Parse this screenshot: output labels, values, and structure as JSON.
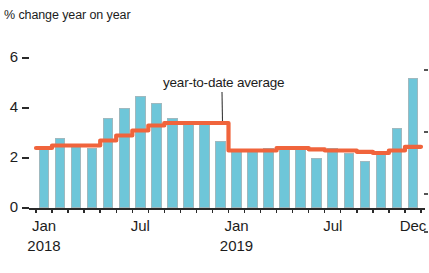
{
  "chart_data": {
    "type": "bar",
    "title": "% change year on year",
    "xlabel": "",
    "ylabel": "% change year on year",
    "ylim": [
      0,
      6
    ],
    "yticks": [
      0,
      2,
      4,
      6
    ],
    "ytick_labels": [
      "0",
      "2",
      "4",
      "6"
    ],
    "grid": false,
    "legend": "none",
    "categories": [
      "Jan 2018",
      "Feb 2018",
      "Mar 2018",
      "Apr 2018",
      "May 2018",
      "Jun 2018",
      "Jul 2018",
      "Aug 2018",
      "Sep 2018",
      "Oct 2018",
      "Nov 2018",
      "Dec 2018",
      "Jan 2019",
      "Feb 2019",
      "Mar 2019",
      "Apr 2019",
      "May 2019",
      "Jun 2019",
      "Jul 2019",
      "Aug 2019",
      "Sep 2019",
      "Oct 2019",
      "Nov 2019",
      "Dec 2019"
    ],
    "series": [
      {
        "name": "monthly % change year on year",
        "type": "bar",
        "values": [
          2.4,
          2.8,
          2.5,
          2.4,
          3.6,
          4.0,
          4.5,
          4.2,
          3.6,
          3.5,
          3.4,
          2.7,
          2.3,
          2.3,
          2.4,
          2.5,
          2.4,
          2.0,
          2.4,
          2.2,
          1.9,
          2.2,
          3.2,
          5.2
        ]
      },
      {
        "name": "year-to-date average",
        "type": "line",
        "color": "#f0643c",
        "values": [
          2.4,
          2.5,
          2.5,
          2.5,
          2.7,
          2.9,
          3.1,
          3.3,
          3.4,
          3.4,
          3.4,
          3.4,
          2.3,
          2.3,
          2.3,
          2.4,
          2.4,
          2.35,
          2.3,
          2.3,
          2.25,
          2.2,
          2.3,
          2.45
        ]
      }
    ],
    "annotations": [
      {
        "text": "year-to-date average",
        "target_category": "Dec 2018"
      }
    ],
    "xtick_labels": [
      {
        "label": "Jan",
        "year": "2018",
        "index": 0
      },
      {
        "label": "Jul",
        "year": "",
        "index": 6
      },
      {
        "label": "Jan",
        "year": "2019",
        "index": 12
      },
      {
        "label": "Jul",
        "year": "",
        "index": 18
      },
      {
        "label": "Dec",
        "year": "",
        "index": 23
      }
    ],
    "colors": {
      "bar_fill": "#6ec6d9",
      "bar_stroke": "#9fb9bf",
      "line": "#f0643c",
      "axis": "#2a2a2a",
      "text": "#1c1c1c",
      "background": "#ffffff"
    }
  }
}
